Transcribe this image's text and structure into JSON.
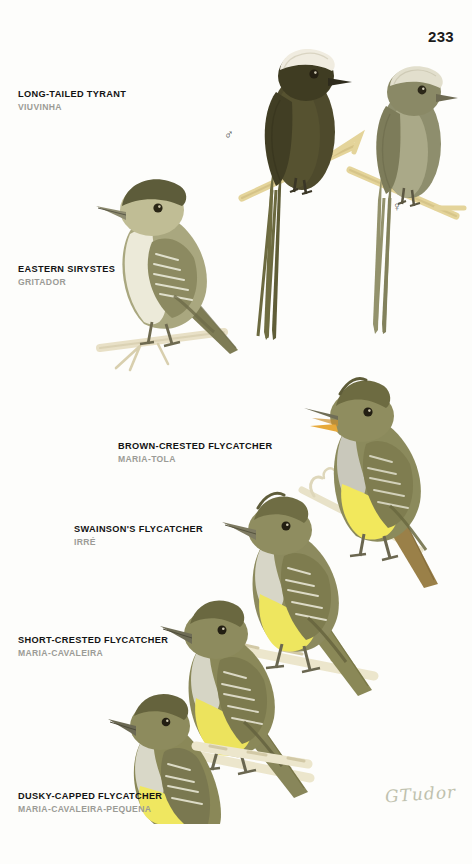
{
  "plate": {
    "page_number": "233",
    "signature": "GTudor",
    "background_color": "#fdfdfb"
  },
  "species": [
    {
      "id": "long-tailed-tyrant",
      "common_name": "LONG-TAILED TYRANT",
      "local_name": "VIUVINHA",
      "caption_x": 18,
      "caption_y": 88,
      "figures": [
        {
          "sex": "male",
          "symbol": "♂",
          "symbol_x": 224,
          "symbol_y": 128
        },
        {
          "sex": "female",
          "symbol": "♀",
          "symbol_x": 392,
          "symbol_y": 202
        }
      ],
      "plumage": {
        "crown": "#f0ece0",
        "body": "#4e4a2c",
        "body_female": "#8e8e6d",
        "bill": "#2e2b1c"
      }
    },
    {
      "id": "eastern-sirystes",
      "common_name": "EASTERN SIRYSTES",
      "local_name": "GRITADOR",
      "caption_x": 18,
      "caption_y": 263,
      "figures": [],
      "plumage": {
        "crown": "#5d5c3a",
        "upperparts": "#8e8d64",
        "underparts": "#e9e7d5",
        "bill": "#73715c"
      }
    },
    {
      "id": "brown-crested-flycatcher",
      "common_name": "BROWN-CRESTED FLYCATCHER",
      "local_name": "MARIA-TOLA",
      "caption_x": 118,
      "caption_y": 440,
      "figures": [],
      "plumage": {
        "crown": "#6d6b41",
        "upperparts": "#8b8a5c",
        "throat": "#c9c8bb",
        "belly": "#f2e85c",
        "tail": "#9a8048",
        "mouth": "#e7a93a"
      }
    },
    {
      "id": "swainsons-flycatcher",
      "common_name": "SWAINSON'S FLYCATCHER",
      "local_name": "IRRÉ",
      "caption_x": 74,
      "caption_y": 523,
      "figures": [],
      "plumage": {
        "crown": "#6f6d44",
        "upperparts": "#8c8a5e",
        "throat": "#d7d6c7",
        "belly": "#eee65f",
        "bill": "#7d7a61"
      }
    },
    {
      "id": "short-crested-flycatcher",
      "common_name": "SHORT-CRESTED FLYCATCHER",
      "local_name": "MARIA-CAVALEIRA",
      "caption_x": 18,
      "caption_y": 634,
      "figures": [],
      "plumage": {
        "crown": "#6a6840",
        "upperparts": "#8a8859",
        "throat": "#d6d5c5",
        "belly": "#ece35d",
        "bill": "#6e6c55"
      }
    },
    {
      "id": "dusky-capped-flycatcher",
      "common_name": "DUSKY-CAPPED FLYCATCHER",
      "local_name": "MARIA-CAVALEIRA-PEQUENA",
      "caption_x": 18,
      "caption_y": 790,
      "figures": [],
      "plumage": {
        "crown": "#65633d",
        "upperparts": "#8a8858",
        "throat": "#d9d8c8",
        "belly": "#efe760",
        "bill": "#6b6953"
      }
    }
  ]
}
